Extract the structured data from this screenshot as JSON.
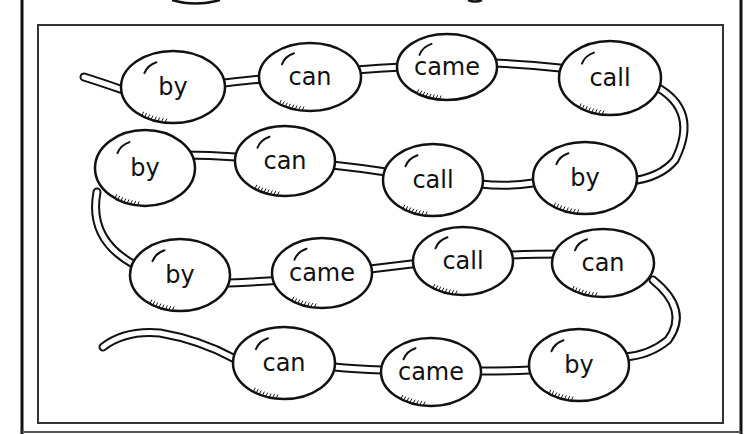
{
  "worksheet": {
    "title": "",
    "colors": {
      "ink": "#111111",
      "paper": "#ffffff",
      "frame": "#333333"
    }
  },
  "beads": [
    {
      "word": "by",
      "cx": 173,
      "cy": 87,
      "rx": 52,
      "ry": 36
    },
    {
      "word": "can",
      "cx": 310,
      "cy": 77,
      "rx": 51,
      "ry": 34
    },
    {
      "word": "came",
      "cx": 447,
      "cy": 67,
      "rx": 50,
      "ry": 33
    },
    {
      "word": "call",
      "cx": 610,
      "cy": 78,
      "rx": 51,
      "ry": 37
    },
    {
      "word": "by",
      "cx": 585,
      "cy": 178,
      "rx": 52,
      "ry": 36
    },
    {
      "word": "call",
      "cx": 433,
      "cy": 180,
      "rx": 50,
      "ry": 36
    },
    {
      "word": "can",
      "cx": 285,
      "cy": 161,
      "rx": 50,
      "ry": 35
    },
    {
      "word": "by",
      "cx": 145,
      "cy": 168,
      "rx": 50,
      "ry": 38
    },
    {
      "word": "by",
      "cx": 180,
      "cy": 275,
      "rx": 50,
      "ry": 36
    },
    {
      "word": "came",
      "cx": 322,
      "cy": 273,
      "rx": 50,
      "ry": 35
    },
    {
      "word": "call",
      "cx": 463,
      "cy": 261,
      "rx": 50,
      "ry": 34
    },
    {
      "word": "can",
      "cx": 603,
      "cy": 263,
      "rx": 51,
      "ry": 34
    },
    {
      "word": "by",
      "cx": 579,
      "cy": 365,
      "rx": 50,
      "ry": 36
    },
    {
      "word": "came",
      "cx": 431,
      "cy": 372,
      "rx": 50,
      "ry": 34
    },
    {
      "word": "can",
      "cx": 284,
      "cy": 363,
      "rx": 51,
      "ry": 36
    }
  ]
}
